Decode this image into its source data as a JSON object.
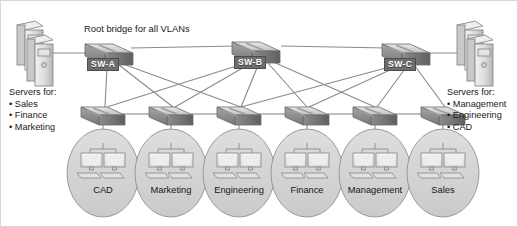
{
  "diagram": {
    "title_note": "Root bridge for all VLANs",
    "left_servers": {
      "header": "Servers for:",
      "items": [
        "• Sales",
        "• Finance",
        "• Marketing"
      ]
    },
    "right_servers": {
      "header": "Servers for:",
      "items": [
        "• Management",
        "• Engineering",
        "• CAD"
      ]
    },
    "core_switches": [
      {
        "name": "SW-A",
        "x": 108,
        "y": 55
      },
      {
        "name": "SW-B",
        "x": 255,
        "y": 52
      },
      {
        "name": "SW-C",
        "x": 405,
        "y": 55
      }
    ],
    "access_switches": [
      {
        "x": 102,
        "y": 112
      },
      {
        "x": 170,
        "y": 112
      },
      {
        "x": 238,
        "y": 112
      },
      {
        "x": 306,
        "y": 112
      },
      {
        "x": 374,
        "y": 112
      },
      {
        "x": 442,
        "y": 112
      }
    ],
    "vlans": [
      {
        "label": "CAD",
        "x": 102,
        "y": 190
      },
      {
        "label": "Marketing",
        "x": 170,
        "y": 190
      },
      {
        "label": "Engineering",
        "x": 238,
        "y": 190
      },
      {
        "label": "Finance",
        "x": 306,
        "y": 190
      },
      {
        "label": "Management",
        "x": 374,
        "y": 190
      },
      {
        "label": "Sales",
        "x": 442,
        "y": 190
      }
    ],
    "colors": {
      "line": "#8a8a8a",
      "switch_top": "#d2d2d2",
      "switch_body": "#8f8f8f",
      "oval_fill": "#d4d4d4",
      "oval_stroke": "#9a9a9a",
      "label_bg": "#6e6e6e",
      "text": "#1a1a1a"
    }
  }
}
